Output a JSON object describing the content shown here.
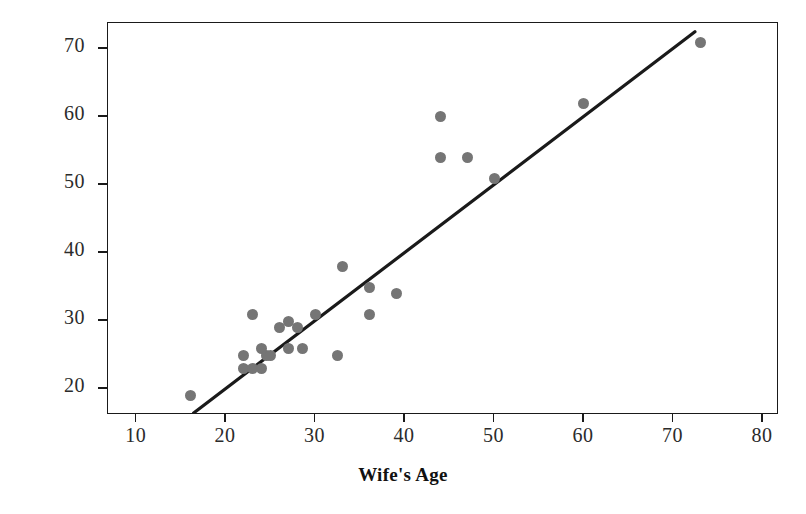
{
  "chart_data": {
    "type": "scatter",
    "title": "",
    "xlabel": "Wife's Age",
    "ylabel": "Husband's Age",
    "xlim": [
      6.8,
      81.8
    ],
    "ylim": [
      16.2,
      73.8
    ],
    "grid": false,
    "legend": false,
    "point_color": "#757575",
    "line_color": "#1a1a1a",
    "xticks": [
      10,
      20,
      30,
      40,
      50,
      60,
      70,
      80
    ],
    "yticks": [
      20,
      30,
      40,
      50,
      60,
      70
    ],
    "xtick_labels": [
      "10",
      "20",
      "30",
      "40",
      "50",
      "60",
      "70",
      "80"
    ],
    "ytick_labels": [
      "20",
      "30",
      "40",
      "50",
      "60",
      "70"
    ],
    "points": [
      {
        "x": 16,
        "y": 19
      },
      {
        "x": 22,
        "y": 23
      },
      {
        "x": 23,
        "y": 23
      },
      {
        "x": 24,
        "y": 23
      },
      {
        "x": 22,
        "y": 25
      },
      {
        "x": 24,
        "y": 26
      },
      {
        "x": 24.5,
        "y": 25
      },
      {
        "x": 25,
        "y": 25
      },
      {
        "x": 23,
        "y": 31
      },
      {
        "x": 26,
        "y": 29
      },
      {
        "x": 27,
        "y": 30
      },
      {
        "x": 28,
        "y": 29
      },
      {
        "x": 27,
        "y": 26
      },
      {
        "x": 28.5,
        "y": 26
      },
      {
        "x": 30,
        "y": 31
      },
      {
        "x": 32.5,
        "y": 25
      },
      {
        "x": 33,
        "y": 38
      },
      {
        "x": 36,
        "y": 35
      },
      {
        "x": 36,
        "y": 31
      },
      {
        "x": 39,
        "y": 34
      },
      {
        "x": 44,
        "y": 60
      },
      {
        "x": 44,
        "y": 54
      },
      {
        "x": 47,
        "y": 54
      },
      {
        "x": 50,
        "y": 51
      },
      {
        "x": 60,
        "y": 62
      },
      {
        "x": 73,
        "y": 71
      }
    ],
    "trend_line": {
      "x_start": 16.4,
      "y_start": 16.2,
      "x_end": 72.6,
      "y_end": 72.5
    }
  }
}
